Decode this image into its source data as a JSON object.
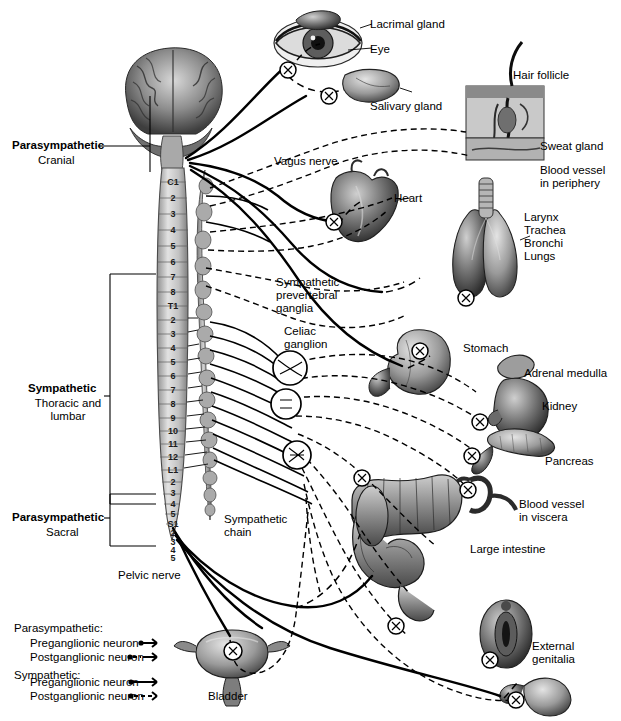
{
  "figure": {
    "type": "anatomical-diagram"
  },
  "divisions": [
    {
      "id": "parasympathetic-cranial",
      "name": "Parasympathetic",
      "sub": "Cranial"
    },
    {
      "id": "sympathetic-thoracolumbar",
      "name": "Sympathetic",
      "sub": "Thoracic and\nlumbar"
    },
    {
      "id": "parasympathetic-sacral",
      "name": "Parasympathetic",
      "sub": "Sacral"
    }
  ],
  "spinal_segments": {
    "cervical": [
      "C1",
      "2",
      "3",
      "4",
      "5",
      "6",
      "7",
      "8"
    ],
    "thoracic": [
      "T1",
      "2",
      "3",
      "4",
      "5",
      "6",
      "7",
      "8",
      "9",
      "10",
      "11",
      "12"
    ],
    "lumbar": [
      "L1",
      "2",
      "3",
      "4",
      "5"
    ],
    "sacral": [
      "S1",
      "2",
      "3",
      "4",
      "5"
    ]
  },
  "nerve_labels": [
    {
      "id": "vagus-nerve",
      "text": "Vagus nerve"
    },
    {
      "id": "pelvic-nerve",
      "text": "Pelvic nerve"
    },
    {
      "id": "sympathetic-chain",
      "text": "Sympathetic\nchain"
    },
    {
      "id": "prevertebral-ganglia",
      "text": "Sympathetic\nprevertebral\nganglia"
    },
    {
      "id": "celiac-ganglion",
      "text": "Celiac\nganglion"
    }
  ],
  "organs": [
    {
      "id": "lacrimal-gland",
      "text": "Lacrimal gland"
    },
    {
      "id": "eye",
      "text": "Eye"
    },
    {
      "id": "salivary-gland",
      "text": "Salivary gland"
    },
    {
      "id": "hair-follicle",
      "text": "Hair follicle"
    },
    {
      "id": "sweat-gland",
      "text": "Sweat gland"
    },
    {
      "id": "blood-vessel-periphery",
      "text": "Blood vessel\nin periphery"
    },
    {
      "id": "heart",
      "text": "Heart"
    },
    {
      "id": "respiratory",
      "text": "Larynx\nTrachea\nBronchi\nLungs"
    },
    {
      "id": "stomach",
      "text": "Stomach"
    },
    {
      "id": "adrenal-medulla",
      "text": "Adrenal medulla"
    },
    {
      "id": "kidney",
      "text": "Kidney"
    },
    {
      "id": "pancreas",
      "text": "Pancreas"
    },
    {
      "id": "blood-vessel-viscera",
      "text": "Blood vessel\nin viscera"
    },
    {
      "id": "large-intestine",
      "text": "Large intestine"
    },
    {
      "id": "bladder",
      "text": "Bladder"
    },
    {
      "id": "external-genitalia",
      "text": "External\ngenitalia"
    }
  ],
  "legend": {
    "parasympathetic_heading": "Parasympathetic:",
    "sympathetic_heading": "Sympathetic:",
    "pre_label": "Preganglionic neuron",
    "post_label": "Postganglionic neuron",
    "entries": [
      {
        "id": "para-pre",
        "label": "Preganglionic neuron",
        "style": "solid-short"
      },
      {
        "id": "para-post",
        "label": "Postganglionic neuron",
        "style": "dashed-short"
      },
      {
        "id": "symp-pre",
        "label": "Preganglionic neuron",
        "style": "solid-long"
      },
      {
        "id": "symp-post",
        "label": "Postganglionic neuron",
        "style": "dashed-long"
      }
    ]
  },
  "colors": {
    "ink": "#000000",
    "paper": "#ffffff",
    "cord_fill": "#cfcfcf",
    "cord_edge": "#5a5a5a",
    "chain_fill": "#b9b9b9",
    "organ_dark": "#3a3a3a",
    "organ_mid": "#7d7d7d",
    "organ_light": "#c8c8c8"
  }
}
